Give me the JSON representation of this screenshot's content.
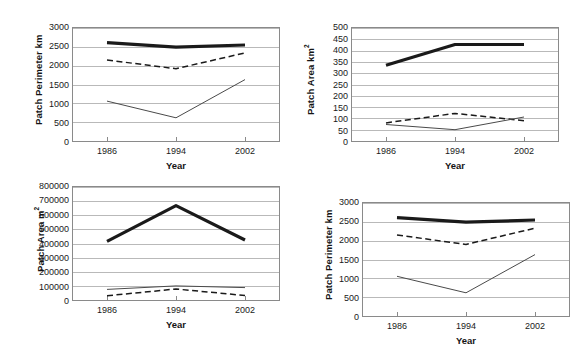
{
  "figure": {
    "background": "#ffffff",
    "axis_color": "#8a8a8a",
    "grid_color": "#b9b9b9",
    "series_colors": {
      "thick_solid": "#1a1a1a",
      "dashed": "#1a1a1a",
      "thin_solid": "#4a4a4a"
    },
    "xlabel": "Year",
    "categories": [
      "1986",
      "1994",
      "2002"
    ]
  },
  "chart_data": [
    {
      "id": "top-left",
      "type": "line",
      "title": "",
      "xlabel": "Year",
      "ylabel": "Patch Perimeter km",
      "ylabel_sup": "",
      "categories": [
        "1986",
        "1994",
        "2002"
      ],
      "x": [
        1986,
        1994,
        2002
      ],
      "ylim": [
        0,
        3000
      ],
      "ytick_step": 500,
      "yticks": [
        "0",
        "500",
        "1000",
        "1500",
        "2000",
        "2500",
        "3000"
      ],
      "grid": true,
      "legend": "none",
      "series": [
        {
          "name": "thick-solid",
          "style": "thick-solid",
          "values": [
            2610,
            2490,
            2550
          ]
        },
        {
          "name": "dashed",
          "style": "dashed",
          "values": [
            2150,
            1920,
            2340
          ]
        },
        {
          "name": "thin-solid",
          "style": "thin-solid",
          "values": [
            1060,
            615,
            1630
          ]
        }
      ]
    },
    {
      "id": "top-right",
      "type": "line",
      "title": "",
      "xlabel": "Year",
      "ylabel": "Patch Area km",
      "ylabel_sup": "2",
      "categories": [
        "1986",
        "1994",
        "2002"
      ],
      "x": [
        1986,
        1994,
        2002
      ],
      "ylim": [
        0,
        500
      ],
      "ytick_step": 50,
      "yticks": [
        "0",
        "50",
        "100",
        "150",
        "200",
        "250",
        "300",
        "350",
        "400",
        "450",
        "500"
      ],
      "grid": true,
      "legend": "none",
      "series": [
        {
          "name": "thick-solid",
          "style": "thick-solid",
          "values": [
            335,
            427,
            427
          ]
        },
        {
          "name": "dashed",
          "style": "dashed",
          "values": [
            80,
            122,
            90
          ]
        },
        {
          "name": "thin-solid",
          "style": "thin-solid",
          "values": [
            73,
            50,
            106
          ]
        }
      ]
    },
    {
      "id": "bottom-left",
      "type": "line",
      "title": "",
      "xlabel": "Year",
      "ylabel": "Patch Area m",
      "ylabel_sup": "2",
      "categories": [
        "1986",
        "1994",
        "2002"
      ],
      "x": [
        1986,
        1994,
        2002
      ],
      "ylim": [
        0,
        800000
      ],
      "ytick_step": 100000,
      "yticks": [
        "0",
        "100000",
        "200000",
        "300000",
        "400000",
        "500000",
        "600000",
        "700000",
        "800000"
      ],
      "grid": true,
      "legend": "none",
      "series": [
        {
          "name": "thick-solid",
          "style": "thick-solid",
          "values": [
            415000,
            668000,
            425000
          ]
        },
        {
          "name": "thin-solid",
          "style": "thin-solid",
          "values": [
            75000,
            100000,
            88000
          ]
        },
        {
          "name": "dashed",
          "style": "dashed",
          "values": [
            30000,
            78000,
            32000
          ]
        }
      ]
    },
    {
      "id": "bottom-right",
      "type": "line",
      "title": "",
      "xlabel": "Year",
      "ylabel": "Patch Perimeter km",
      "ylabel_sup": "",
      "categories": [
        "1986",
        "1994",
        "2002"
      ],
      "x": [
        1986,
        1994,
        2002
      ],
      "ylim": [
        0,
        3000
      ],
      "ytick_step": 500,
      "yticks": [
        "0",
        "500",
        "1000",
        "1500",
        "2000",
        "2500",
        "3000"
      ],
      "grid": true,
      "legend": "none",
      "series": [
        {
          "name": "thick-solid",
          "style": "thick-solid",
          "values": [
            2610,
            2490,
            2550
          ]
        },
        {
          "name": "dashed",
          "style": "dashed",
          "values": [
            2150,
            1900,
            2330
          ]
        },
        {
          "name": "thin-solid",
          "style": "thin-solid",
          "values": [
            1055,
            615,
            1630
          ]
        }
      ]
    }
  ]
}
